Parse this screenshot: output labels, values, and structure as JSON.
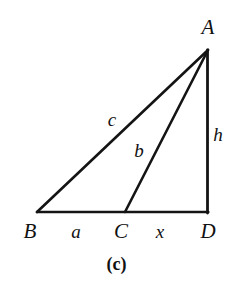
{
  "figure": {
    "caption": "(c)",
    "background_color": "#ffffff",
    "stroke_color": "#141414",
    "stroke_width": 2.6,
    "width": 233,
    "height": 287,
    "type": "geometry-diagram",
    "shape": "right triangle with interior cevian"
  },
  "vertices": [
    {
      "id": "A",
      "label": "A",
      "x": 208,
      "y": 50,
      "label_x": 208,
      "label_y": 27
    },
    {
      "id": "B",
      "label": "B",
      "x": 37,
      "y": 212,
      "label_x": 30,
      "label_y": 231
    },
    {
      "id": "C",
      "label": "C",
      "x": 125,
      "y": 212,
      "label_x": 121,
      "label_y": 231
    },
    {
      "id": "D",
      "label": "D",
      "x": 207,
      "y": 212,
      "label_x": 208,
      "label_y": 231
    }
  ],
  "segments": [
    {
      "id": "BA",
      "from": "B",
      "to": "A",
      "label": "c",
      "label_x": 112,
      "label_y": 119
    },
    {
      "id": "CA",
      "from": "C",
      "to": "A",
      "label": "b",
      "label_x": 139,
      "label_y": 150
    },
    {
      "id": "AD",
      "from": "A",
      "to": "D",
      "label": "h",
      "label_x": 218,
      "label_y": 134
    },
    {
      "id": "BC",
      "from": "B",
      "to": "C",
      "label": "a",
      "label_x": 76,
      "label_y": 231
    },
    {
      "id": "CD",
      "from": "C",
      "to": "D",
      "label": "x",
      "label_x": 160,
      "label_y": 231
    }
  ],
  "caption_position": {
    "x": 0,
    "y": 255
  }
}
